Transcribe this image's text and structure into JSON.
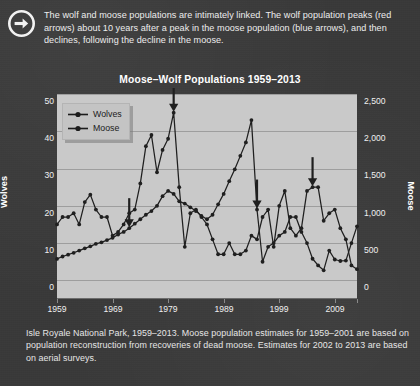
{
  "callout": {
    "icon": "arrow-right-circle-icon",
    "text": "The wolf and moose populations are intimately linked. The wolf population peaks (red arrows) about 10 years after a peak in the moose population (blue arrows), and then declines, following the decline in the moose."
  },
  "caption": {
    "text": "Isle Royale National Park, 1959–2013. Moose population estimates for 1959–2001 are based on population reconstruction from recoveries of dead moose. Estimates for 2002 to 2013 are based on aerial surveys."
  },
  "legend": {
    "items": [
      {
        "label": "Wolves",
        "color": "#1f1f1f",
        "marker": "circle"
      },
      {
        "label": "Moose",
        "color": "#1f1f1f",
        "marker": "circle"
      }
    ]
  },
  "axes": {
    "left_title": "Wolves",
    "right_title": "Moose",
    "left_ticks": [
      "0",
      "10",
      "20",
      "30",
      "40",
      "50"
    ],
    "right_ticks": [
      "0",
      "500",
      "1,000",
      "1,500",
      "2,000",
      "2,500"
    ],
    "x_ticks": [
      "1959",
      "1969",
      "1979",
      "1989",
      "1999",
      "2009"
    ]
  },
  "chart_data": {
    "type": "line",
    "title": "Moose–Wolf Populations 1959–2013",
    "xlabel": "",
    "ylabel": "Wolves",
    "y2label": "Moose",
    "xlim": [
      1959,
      2013
    ],
    "ylim": [
      0,
      55
    ],
    "y2lim": [
      0,
      2750
    ],
    "yticks": [
      0,
      10,
      20,
      30,
      40,
      50
    ],
    "y2ticks": [
      0,
      500,
      1000,
      1500,
      2000,
      2500
    ],
    "xticks": [
      1959,
      1969,
      1979,
      1989,
      1999,
      2009
    ],
    "grid": true,
    "legend_position": "top-left",
    "x": [
      1959,
      1960,
      1961,
      1962,
      1963,
      1964,
      1965,
      1966,
      1967,
      1968,
      1969,
      1970,
      1971,
      1972,
      1973,
      1974,
      1975,
      1976,
      1977,
      1978,
      1979,
      1980,
      1981,
      1982,
      1983,
      1984,
      1985,
      1986,
      1987,
      1988,
      1989,
      1990,
      1991,
      1992,
      1993,
      1994,
      1995,
      1996,
      1997,
      1998,
      1999,
      2000,
      2001,
      2002,
      2003,
      2004,
      2005,
      2006,
      2007,
      2008,
      2009,
      2010,
      2011,
      2012,
      2013
    ],
    "series": [
      {
        "name": "Wolves",
        "axis": "left",
        "units": "count",
        "values": [
          20,
          22,
          22,
          23,
          20,
          26,
          28,
          24,
          22,
          22,
          17,
          18,
          20,
          23,
          24,
          31,
          41,
          44,
          34,
          40,
          43,
          50,
          30,
          14,
          23,
          24,
          22,
          20,
          16,
          12,
          12,
          15,
          12,
          12,
          13,
          17,
          16,
          22,
          24,
          14,
          25,
          29,
          19,
          17,
          19,
          29,
          30,
          30,
          21,
          23,
          24,
          19,
          16,
          9,
          8
        ]
      },
      {
        "name": "Moose",
        "axis": "right",
        "units": "count",
        "values": [
          538,
          570,
          595,
          620,
          650,
          680,
          706,
          740,
          760,
          790,
          820,
          865,
          900,
          950,
          1010,
          1070,
          1130,
          1180,
          1250,
          1380,
          1450,
          1410,
          1310,
          1280,
          1230,
          1180,
          1115,
          1070,
          1130,
          1270,
          1410,
          1580,
          1740,
          1920,
          2100,
          2400,
          1200,
          500,
          700,
          750,
          850,
          900,
          1100,
          1100,
          900,
          750,
          540,
          450,
          385,
          650,
          530,
          510,
          515,
          750,
          975
        ]
      }
    ],
    "annotations": [
      {
        "type": "arrow",
        "label": "moose-peak-arrow",
        "color": "#1f1f1f",
        "points_to_series": "Moose",
        "year": 1972
      },
      {
        "type": "arrow",
        "label": "wolf-peak-arrow",
        "color": "#1f1f1f",
        "points_to_series": "Wolves",
        "year": 1980
      },
      {
        "type": "arrow",
        "label": "moose-peak-arrow",
        "color": "#1f1f1f",
        "points_to_series": "Moose",
        "year": 1995
      },
      {
        "type": "arrow",
        "label": "wolf-peak-arrow",
        "color": "#1f1f1f",
        "points_to_series": "Wolves",
        "year": 2005
      }
    ]
  }
}
